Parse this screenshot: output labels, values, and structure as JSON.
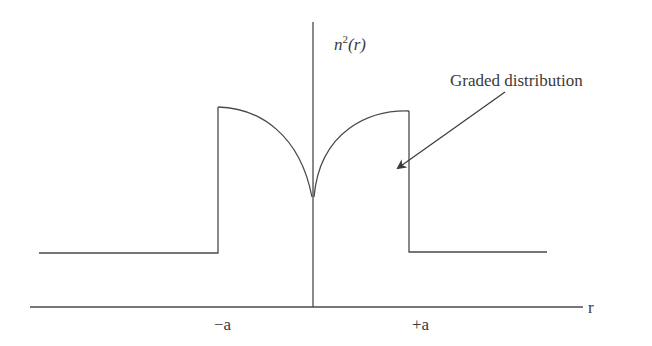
{
  "diagram": {
    "y_axis_label": "n",
    "y_axis_label_sup": "2",
    "y_axis_label_arg": "(r)",
    "x_axis_label": "r",
    "ticks": {
      "left": "−a",
      "right": "+a"
    },
    "annotation": "Graded distribution",
    "colors": {
      "line": "#4a4a4a",
      "text": "#3a3a3a",
      "background": "#ffffff"
    }
  }
}
